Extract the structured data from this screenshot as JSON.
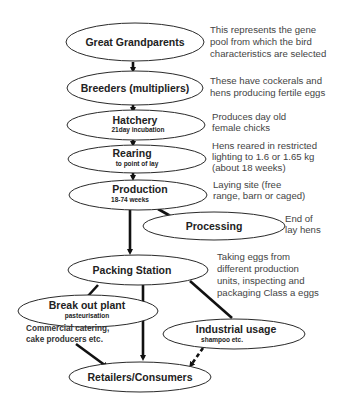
{
  "diagram": {
    "nodes": {
      "great_grandparents": {
        "label": "Great Grandparents",
        "sub": ""
      },
      "breeders": {
        "label": "Breeders (multipliers)",
        "sub": ""
      },
      "hatchery": {
        "label": "Hatchery",
        "sub": "21day incubation"
      },
      "rearing": {
        "label": "Rearing",
        "sub": "to point of lay"
      },
      "production": {
        "label": "Production",
        "sub": "18-74 weeks"
      },
      "processing": {
        "label": "Processing",
        "sub": ""
      },
      "packing_station": {
        "label": "Packing Station",
        "sub": ""
      },
      "break_out_plant": {
        "label": "Break out plant",
        "sub": "pasteurisation"
      },
      "industrial_usage": {
        "label": "Industrial usage",
        "sub": "shampoo etc."
      },
      "retailers": {
        "label": "Retailers/Consumers",
        "sub": ""
      }
    },
    "notes": {
      "great_grandparents": [
        "This represents the gene",
        "pool from which the bird",
        "characteristics are selected"
      ],
      "breeders": [
        "These have cockerals and",
        "hens producing fertile eggs"
      ],
      "hatchery": [
        "Produces day old",
        "female chicks"
      ],
      "rearing": [
        "Hens reared in restricted",
        "lighting to 1.6 or 1.65 kg",
        "(about 18 weeks)"
      ],
      "production": [
        "Laying site (free",
        "range, barn or caged)"
      ],
      "processing": [
        "End of",
        "lay hens"
      ],
      "packing_station": [
        "Taking eggs from",
        "different production",
        "units, inspecting and",
        "packaging Class a eggs"
      ],
      "break_out_plant": [
        "Commercial catering,",
        "cake producers etc."
      ]
    },
    "edges": [
      {
        "from": "great_grandparents",
        "to": "breeders",
        "style": "solid"
      },
      {
        "from": "breeders",
        "to": "hatchery",
        "style": "solid"
      },
      {
        "from": "hatchery",
        "to": "rearing",
        "style": "solid"
      },
      {
        "from": "rearing",
        "to": "production",
        "style": "solid"
      },
      {
        "from": "production",
        "to": "processing",
        "style": "solid"
      },
      {
        "from": "production",
        "to": "packing_station",
        "style": "solid"
      },
      {
        "from": "packing_station",
        "to": "break_out_plant",
        "style": "solid"
      },
      {
        "from": "packing_station",
        "to": "retailers",
        "style": "solid"
      },
      {
        "from": "packing_station",
        "to": "industrial_usage",
        "style": "solid"
      },
      {
        "from": "break_out_plant",
        "to": "retailers",
        "style": "solid"
      },
      {
        "from": "industrial_usage",
        "to": "retailers",
        "style": "dashed"
      }
    ],
    "colors": {
      "stroke": "#2a2a2a",
      "text": "#222222",
      "note_text": "#444444",
      "background": "#ffffff"
    }
  }
}
